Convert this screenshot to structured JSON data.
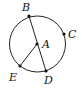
{
  "diagram": {
    "type": "circle-geometry",
    "circle": {
      "center": "A",
      "cx": 37.5,
      "cy": 44,
      "r": 28
    },
    "points": [
      {
        "label": "A",
        "x": 37,
        "y": 44,
        "lx": 42,
        "ly": 48
      },
      {
        "label": "B",
        "x": 29,
        "y": 16,
        "lx": 22,
        "ly": 11
      },
      {
        "label": "C",
        "x": 64,
        "y": 34,
        "lx": 68,
        "ly": 38
      },
      {
        "label": "D",
        "x": 46,
        "y": 71,
        "lx": 44,
        "ly": 84
      },
      {
        "label": "E",
        "x": 20,
        "y": 66,
        "lx": 9,
        "ly": 81
      }
    ],
    "segments": [
      {
        "from": "B",
        "to": "D",
        "name": "diameter"
      },
      {
        "from": "A",
        "to": "E",
        "name": "radius"
      }
    ],
    "colors": {
      "stroke": "#222222",
      "text": "#111111"
    }
  }
}
